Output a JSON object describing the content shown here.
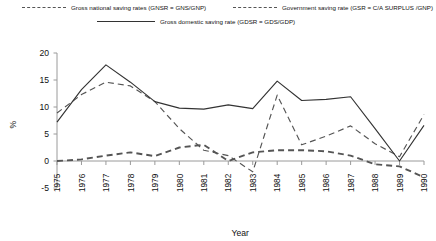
{
  "chart_data": {
    "type": "line",
    "title": "",
    "xlabel": "Year",
    "ylabel": "%",
    "x": [
      1975,
      1976,
      1977,
      1978,
      1979,
      1980,
      1981,
      1982,
      1983,
      1984,
      1985,
      1986,
      1987,
      1988,
      1989,
      1990
    ],
    "xtick_labels": [
      "1975",
      "1976",
      "1977",
      "1978",
      "1979",
      "1980",
      "1981",
      "1982",
      "1983",
      "1984",
      "1985",
      "1986",
      "1987",
      "1988",
      "1989",
      "1990"
    ],
    "ytick_labels": [
      "-5",
      "0",
      "5",
      "10",
      "15",
      "20"
    ],
    "yticks": [
      -5,
      0,
      5,
      10,
      15,
      20
    ],
    "ylim": [
      -5,
      20
    ],
    "xlim": [
      1975,
      1990
    ],
    "grid": false,
    "legend_position": "top",
    "series": [
      {
        "name": "Gross national saving rates (GNSR = GNS/GNP)",
        "key": "gnsr",
        "style": "dashed-thin",
        "color": "#555555",
        "values": [
          8.9,
          12.3,
          14.6,
          13.9,
          11.0,
          6.0,
          2.0,
          1.0,
          -2.0,
          12.2,
          3.0,
          4.6,
          6.5,
          3.2,
          0.8,
          8.6
        ]
      },
      {
        "name": "Government saving rate (GSR = C/A SURPLUS /GNP)",
        "key": "gsr",
        "style": "dashed-thick",
        "color": "#555555",
        "values": [
          0.0,
          0.3,
          1.0,
          1.6,
          0.9,
          2.5,
          3.0,
          0.0,
          1.6,
          2.0,
          2.0,
          1.8,
          1.0,
          -0.6,
          -1.0,
          -3.0
        ]
      },
      {
        "name": "Gross domestic saving rate (GDSR = GDS/GDP)",
        "key": "gdsr",
        "style": "solid",
        "color": "#333333",
        "values": [
          7.2,
          13.2,
          17.8,
          14.6,
          11.0,
          9.8,
          9.6,
          10.4,
          9.7,
          14.8,
          11.2,
          11.4,
          11.9,
          6.0,
          0.0,
          6.6
        ]
      }
    ]
  },
  "legend": {
    "items": [
      {
        "label": "Gross national saving rates (GNSR = GNS/GNP)",
        "style": "dashed-thin"
      },
      {
        "label": "Government saving rate (GSR = C/A SURPLUS /GNP)",
        "style": "dashed-thick"
      },
      {
        "label": "Gross domestic saving rate (GDSR = GDS/GDP)",
        "style": "solid"
      }
    ]
  },
  "colors": {
    "axis": "#9a9a9a",
    "text": "#111111",
    "solid_series": "#333333",
    "dashed_series": "#555555",
    "background": "#ffffff"
  }
}
